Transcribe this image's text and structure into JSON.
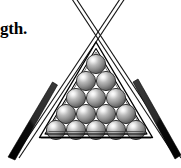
{
  "figure": {
    "background_color": "#ffffff",
    "ink_color": "#000000",
    "width": 181,
    "height": 168
  },
  "caption": {
    "text_fragment": "gth.",
    "note": "clipped end of a word at the left image edge"
  },
  "rack": {
    "label": "triangle-rack",
    "frame_style": "double-outline triangle",
    "apex": {
      "x": 96,
      "y": 42
    },
    "base_left": {
      "x": 40,
      "y": 137
    },
    "base_right": {
      "x": 152,
      "y": 137
    },
    "inner_inset_px": 5,
    "stroke_color": "#000000",
    "stroke_width": 1.4
  },
  "balls": {
    "label": "billiard-balls",
    "total": 15,
    "rows": [
      1,
      2,
      3,
      4,
      5
    ],
    "diameter_px": 19,
    "fill_light": "#f2f2f2",
    "fill_mid": "#9a9a9a",
    "fill_dark": "#5a5a5a",
    "outline_color": "#2b2b2b",
    "highlight_color": "#ffffff",
    "positions": [
      {
        "row": 1,
        "cx": 96,
        "cy": 64
      },
      {
        "row": 2,
        "cx": 86,
        "cy": 81
      },
      {
        "row": 2,
        "cx": 106,
        "cy": 81
      },
      {
        "row": 3,
        "cx": 76,
        "cy": 98
      },
      {
        "row": 3,
        "cx": 96,
        "cy": 98
      },
      {
        "row": 3,
        "cx": 116,
        "cy": 98
      },
      {
        "row": 4,
        "cx": 66,
        "cy": 114
      },
      {
        "row": 4,
        "cx": 86,
        "cy": 114
      },
      {
        "row": 4,
        "cx": 106,
        "cy": 114
      },
      {
        "row": 4,
        "cx": 126,
        "cy": 114
      },
      {
        "row": 5,
        "cx": 56,
        "cy": 130
      },
      {
        "row": 5,
        "cx": 76,
        "cy": 130
      },
      {
        "row": 5,
        "cx": 96,
        "cy": 130
      },
      {
        "row": 5,
        "cx": 116,
        "cy": 130
      },
      {
        "row": 5,
        "cx": 136,
        "cy": 130
      }
    ]
  },
  "cues": {
    "label": "crossed-cue-sticks",
    "count": 2,
    "cross_point": {
      "x": 96,
      "y": 11
    },
    "shaft_style": "thin double outline",
    "butt_style": "solid black taper",
    "butt_color": "#0d0d0d",
    "shaft_color": "#1a1a1a",
    "left": {
      "name": "cue-stick-left",
      "tip": {
        "x": 120,
        "y": 0
      },
      "butt_end": {
        "x": 12,
        "y": 160
      },
      "butt_starts_at_y": 88
    },
    "right": {
      "name": "cue-stick-right",
      "tip": {
        "x": 74,
        "y": 0
      },
      "butt_end": {
        "x": 176,
        "y": 160
      },
      "butt_starts_at_y": 88
    }
  }
}
